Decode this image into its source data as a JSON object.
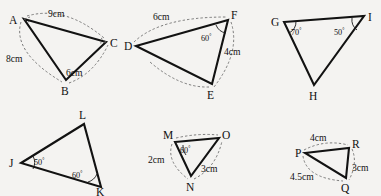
{
  "figure": {
    "background_color": "#f4f3f1",
    "line_color": "#121212",
    "measure_color": "#5d5d5d",
    "degree_symbol": "°",
    "triangles": [
      {
        "id": "triangle-abc",
        "vertices": [
          {
            "name": "A",
            "label": "A",
            "x": 24,
            "y": 19,
            "label_x": 9,
            "label_y": 24
          },
          {
            "name": "C",
            "label": "C",
            "x": 106,
            "y": 42,
            "label_x": 110,
            "label_y": 47
          },
          {
            "name": "B",
            "label": "B",
            "x": 66,
            "y": 80,
            "label_x": 61,
            "label_y": 95
          }
        ],
        "sides": [
          {
            "name": "side-ac",
            "label": "9cm",
            "label_x": 48,
            "label_y": 17
          },
          {
            "name": "side-ab",
            "label": "8cm",
            "label_x": 6,
            "label_y": 62
          },
          {
            "name": "side-bc",
            "label": "6cm",
            "label_x": 66,
            "label_y": 76
          }
        ],
        "angles": []
      },
      {
        "id": "triangle-def",
        "vertices": [
          {
            "name": "D",
            "label": "D",
            "x": 136,
            "y": 46,
            "label_x": 124,
            "label_y": 50
          },
          {
            "name": "F",
            "label": "F",
            "x": 228,
            "y": 20,
            "label_x": 231,
            "label_y": 19
          },
          {
            "name": "E",
            "label": "E",
            "x": 212,
            "y": 84,
            "label_x": 207,
            "label_y": 99
          }
        ],
        "sides": [
          {
            "name": "side-df",
            "label": "6cm",
            "label_x": 153,
            "label_y": 20
          },
          {
            "name": "side-fe",
            "label": "4cm",
            "label_x": 224,
            "label_y": 55
          }
        ],
        "angles": [
          {
            "name": "angle-f",
            "value": "60",
            "label_x": 201,
            "label_y": 41
          }
        ]
      },
      {
        "id": "triangle-ghi",
        "vertices": [
          {
            "name": "G",
            "label": "G",
            "x": 284,
            "y": 22,
            "label_x": 271,
            "label_y": 26
          },
          {
            "name": "I",
            "label": "I",
            "x": 364,
            "y": 16,
            "label_x": 368,
            "label_y": 21
          },
          {
            "name": "H",
            "label": "H",
            "x": 314,
            "y": 85,
            "label_x": 309,
            "label_y": 100
          }
        ],
        "sides": [],
        "angles": [
          {
            "name": "angle-g",
            "value": "70",
            "label_x": 291,
            "label_y": 35
          },
          {
            "name": "angle-i",
            "value": "50",
            "label_x": 337,
            "label_y": 35
          }
        ]
      },
      {
        "id": "triangle-jkl",
        "vertices": [
          {
            "name": "J",
            "label": "J",
            "x": 21,
            "y": 163,
            "label_x": 9,
            "label_y": 167
          },
          {
            "name": "L",
            "label": "L",
            "x": 84,
            "y": 124,
            "label_x": 79,
            "label_y": 119
          },
          {
            "name": "K",
            "label": "K",
            "x": 101,
            "y": 187,
            "label_x": 96,
            "label_y": 198
          }
        ],
        "sides": [],
        "angles": [
          {
            "name": "angle-j",
            "value": "50",
            "label_x": 30,
            "label_y": 161
          },
          {
            "name": "angle-k",
            "value": "60",
            "label_x": 74,
            "label_y": 179
          }
        ]
      },
      {
        "id": "triangle-mno",
        "vertices": [
          {
            "name": "M",
            "label": "M",
            "x": 175,
            "y": 142,
            "label_x": 163,
            "label_y": 139
          },
          {
            "name": "O",
            "label": "O",
            "x": 219,
            "y": 138,
            "label_x": 222,
            "label_y": 139
          },
          {
            "name": "N",
            "label": "N",
            "x": 191,
            "y": 176,
            "label_x": 186,
            "label_y": 191
          }
        ],
        "sides": [
          {
            "name": "side-mn",
            "label": "2cm",
            "label_x": 148,
            "label_y": 163
          },
          {
            "name": "side-no",
            "label": "3cm",
            "label_x": 204,
            "label_y": 172
          }
        ],
        "angles": [
          {
            "name": "angle-m",
            "value": "60",
            "label_x": 180,
            "label_y": 153
          }
        ]
      },
      {
        "id": "triangle-pqr",
        "vertices": [
          {
            "name": "P",
            "label": "P",
            "x": 305,
            "y": 153,
            "label_x": 295,
            "label_y": 157
          },
          {
            "name": "R",
            "label": "R",
            "x": 349,
            "y": 148,
            "label_x": 352,
            "label_y": 148
          },
          {
            "name": "Q",
            "label": "Q",
            "x": 346,
            "y": 178,
            "label_x": 341,
            "label_y": 192
          }
        ],
        "sides": [
          {
            "name": "side-pr",
            "label": "4cm",
            "label_x": 310,
            "label_y": 141
          },
          {
            "name": "side-rq",
            "label": "3cm",
            "label_x": 352,
            "label_y": 168
          },
          {
            "name": "side-pq",
            "label": "4.5cm",
            "label_x": 296,
            "label_y": 178
          }
        ],
        "angles": []
      }
    ]
  }
}
